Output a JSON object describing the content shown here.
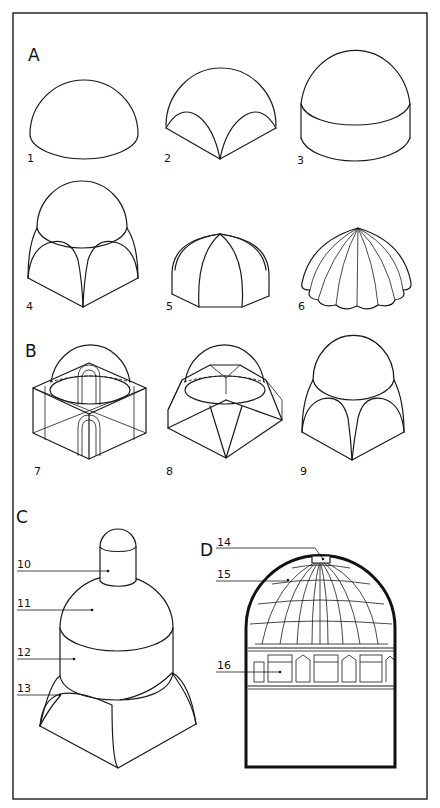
{
  "diagram": {
    "frame_color": "#1a1a1a",
    "background": "#ffffff",
    "sections": [
      {
        "id": "A",
        "label": "A"
      },
      {
        "id": "B",
        "label": "B"
      },
      {
        "id": "C",
        "label": "C"
      },
      {
        "id": "D",
        "label": "D"
      }
    ],
    "figures": [
      {
        "n": "1",
        "label": "1",
        "section": "A",
        "desc": "hemispherical dome"
      },
      {
        "n": "2",
        "label": "2",
        "section": "A",
        "desc": "dome on pendentives (sail vault)"
      },
      {
        "n": "3",
        "label": "3",
        "section": "A",
        "desc": "dome on cylindrical drum"
      },
      {
        "n": "4",
        "label": "4",
        "section": "A",
        "desc": "dome on pendentives over square"
      },
      {
        "n": "5",
        "label": "5",
        "section": "A",
        "desc": "ribbed / segmented dome"
      },
      {
        "n": "6",
        "label": "6",
        "section": "A",
        "desc": "umbrella (scalloped) dome"
      },
      {
        "n": "7",
        "label": "7",
        "section": "B",
        "desc": "squinch construction"
      },
      {
        "n": "8",
        "label": "8",
        "section": "B",
        "desc": "trompe / faceted transition"
      },
      {
        "n": "9",
        "label": "9",
        "section": "B",
        "desc": "pendentive construction"
      },
      {
        "n": "10",
        "label": "10",
        "section": "C",
        "desc": "lantern"
      },
      {
        "n": "11",
        "label": "11",
        "section": "C",
        "desc": "dome cap"
      },
      {
        "n": "12",
        "label": "12",
        "section": "C",
        "desc": "drum"
      },
      {
        "n": "13",
        "label": "13",
        "section": "C",
        "desc": "pendentive"
      },
      {
        "n": "14",
        "label": "14",
        "section": "D",
        "desc": "oculus / lantern opening"
      },
      {
        "n": "15",
        "label": "15",
        "section": "D",
        "desc": "coffered dome shell"
      },
      {
        "n": "16",
        "label": "16",
        "section": "D",
        "desc": "drum with windows"
      }
    ]
  }
}
